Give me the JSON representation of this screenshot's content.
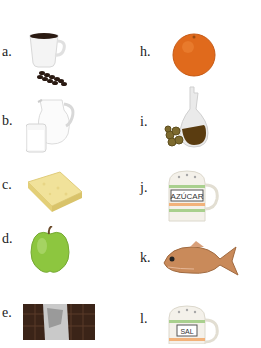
{
  "worksheet": {
    "left_column": [
      {
        "letter": "a.",
        "item": "coffee-cup-with-beans"
      },
      {
        "letter": "b.",
        "item": "milk-jug-and-glass"
      },
      {
        "letter": "c.",
        "item": "cheese-block"
      },
      {
        "letter": "d.",
        "item": "apple"
      },
      {
        "letter": "e.",
        "item": "chocolate-bar"
      }
    ],
    "right_column": [
      {
        "letter": "h.",
        "item": "orange"
      },
      {
        "letter": "i.",
        "item": "oil-cruet-with-olives"
      },
      {
        "letter": "j.",
        "item": "sugar-container",
        "text": "AZÚCAR"
      },
      {
        "letter": "k.",
        "item": "fish"
      },
      {
        "letter": "l.",
        "item": "salt-container",
        "text": "SAL"
      }
    ]
  },
  "colors": {
    "coffee": "#2a1a12",
    "orange": "#e06a1c",
    "apple": "#8dc63f",
    "cheese": "#f1e29a",
    "chocolate": "#3b2418",
    "oil": "#5a3c10",
    "olives": "#7d6a2e",
    "fish": "#c98a5a",
    "stripe_green": "#a9d08e",
    "stripe_orange": "#f2b27a"
  }
}
